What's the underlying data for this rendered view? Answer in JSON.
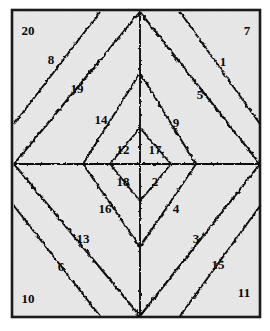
{
  "figure": {
    "background_color": "#ffffff",
    "panel_fill": "#e8e8e8",
    "frame_color": "#1a1a1a",
    "line_color": "#111111",
    "label_color": "#0a0a0a",
    "frame": {
      "x": 11,
      "y": 9,
      "width": 250,
      "height": 309
    },
    "center": {
      "x": 140,
      "y": 164
    }
  },
  "chart_data": {
    "type": "diagram",
    "structure": "four quadrants each split into five nested diamond bands by hand-drawn wavy contours",
    "region_count": 20,
    "axes": {
      "horizontal_line_y": 164,
      "vertical_line_x": 140
    },
    "diamond_ring_vertices": [
      {
        "ring": 1,
        "right_x": 196,
        "left_x": 83,
        "top_y": 73,
        "bottom_y": 247
      },
      {
        "ring": 2,
        "right_x": 260,
        "left_x": 14,
        "top_y": 12,
        "bottom_y": 316
      }
    ],
    "quadrants": [
      {
        "name": "top-left",
        "regions_outer_to_inner": [
          20,
          8,
          19,
          14,
          12
        ]
      },
      {
        "name": "top-right",
        "regions_outer_to_inner": [
          7,
          1,
          5,
          9,
          17
        ]
      },
      {
        "name": "bottom-left",
        "regions_outer_to_inner": [
          10,
          6,
          13,
          16,
          18
        ]
      },
      {
        "name": "bottom-right",
        "regions_outer_to_inner": [
          11,
          15,
          3,
          4,
          2
        ]
      }
    ]
  },
  "labels": [
    {
      "text": "20",
      "x": 28,
      "y": 30,
      "quadrant": "top-left",
      "band": "outer"
    },
    {
      "text": "8",
      "x": 51,
      "y": 59,
      "quadrant": "top-left",
      "band": "2"
    },
    {
      "text": "19",
      "x": 77,
      "y": 88,
      "quadrant": "top-left",
      "band": "3"
    },
    {
      "text": "14",
      "x": 101,
      "y": 119,
      "quadrant": "top-left",
      "band": "4"
    },
    {
      "text": "12",
      "x": 123,
      "y": 149,
      "quadrant": "top-left",
      "band": "inner"
    },
    {
      "text": "7",
      "x": 247,
      "y": 30,
      "quadrant": "top-right",
      "band": "outer"
    },
    {
      "text": "1",
      "x": 223,
      "y": 61,
      "quadrant": "top-right",
      "band": "2"
    },
    {
      "text": "5",
      "x": 200,
      "y": 94,
      "quadrant": "top-right",
      "band": "3"
    },
    {
      "text": "9",
      "x": 176,
      "y": 122,
      "quadrant": "top-right",
      "band": "4"
    },
    {
      "text": "17",
      "x": 155,
      "y": 149,
      "quadrant": "top-right",
      "band": "inner"
    },
    {
      "text": "18",
      "x": 123,
      "y": 181,
      "quadrant": "bottom-left",
      "band": "inner"
    },
    {
      "text": "16",
      "x": 105,
      "y": 208,
      "quadrant": "bottom-left",
      "band": "4"
    },
    {
      "text": "13",
      "x": 83,
      "y": 238,
      "quadrant": "bottom-left",
      "band": "3"
    },
    {
      "text": "6",
      "x": 61,
      "y": 266,
      "quadrant": "bottom-left",
      "band": "2"
    },
    {
      "text": "10",
      "x": 28,
      "y": 298,
      "quadrant": "bottom-left",
      "band": "outer"
    },
    {
      "text": "2",
      "x": 155,
      "y": 181,
      "quadrant": "bottom-right",
      "band": "inner"
    },
    {
      "text": "4",
      "x": 176,
      "y": 208,
      "quadrant": "bottom-right",
      "band": "4"
    },
    {
      "text": "3",
      "x": 196,
      "y": 238,
      "quadrant": "bottom-right",
      "band": "3"
    },
    {
      "text": "15",
      "x": 218,
      "y": 264,
      "quadrant": "bottom-right",
      "band": "2"
    },
    {
      "text": "11",
      "x": 244,
      "y": 292,
      "quadrant": "bottom-right",
      "band": "outer"
    }
  ]
}
